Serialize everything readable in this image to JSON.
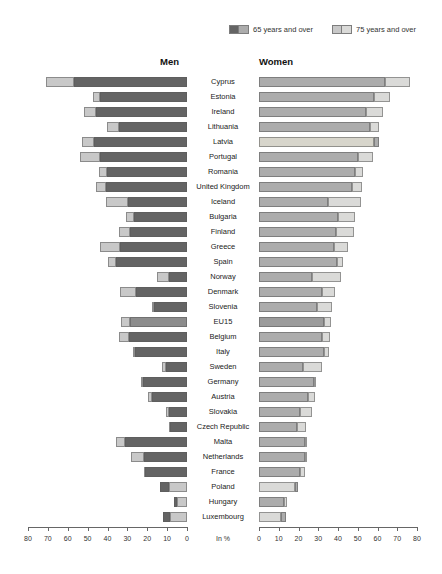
{
  "legend": {
    "items": [
      {
        "label": "65 years and over",
        "swatch": [
          "#646464",
          "#acacac"
        ]
      },
      {
        "label": "75 years and over",
        "swatch": [
          "#c8c8c8",
          "#dadad8"
        ]
      }
    ]
  },
  "headers": {
    "men": "Men",
    "women": "Women"
  },
  "axis": {
    "unit_label": "In %",
    "ticks": [
      0,
      10,
      20,
      30,
      40,
      50,
      60,
      70,
      80
    ],
    "max": 80
  },
  "colors": {
    "men_65": "#646464",
    "men_75": "#c8c8c8",
    "women_65": "#acacac",
    "women_75": "#dadad8",
    "eu15_men_65": "#8c8c8c",
    "eu15_women_65": "#9b9b9b",
    "latvia_women_75": "#d7d5cb",
    "axis": "#666666"
  },
  "chart_data": {
    "type": "bar",
    "orientation": "horizontal-mirrored",
    "unit": "%",
    "xlim": [
      0,
      80
    ],
    "grid": false,
    "legend_position": "top-right",
    "note": "Two overlapping bars per country and sex; the shorter of the 65+/75+ values is drawn on top, the longer shows as a lighter/darker tip.",
    "categories": [
      "Cyprus",
      "Estonia",
      "Ireland",
      "Lithuania",
      "Latvia",
      "Portugal",
      "Romania",
      "United Kingdom",
      "Iceland",
      "Bulgaria",
      "Finland",
      "Greece",
      "Spain",
      "Norway",
      "Denmark",
      "Slovenia",
      "EU15",
      "Belgium",
      "Italy",
      "Sweden",
      "Germany",
      "Austria",
      "Slovakia",
      "Czech Republic",
      "Malta",
      "Netherlands",
      "France",
      "Poland",
      "Hungary",
      "Luxembourg"
    ],
    "series": [
      {
        "name": "Men 65 years and over",
        "values": [
          57,
          44,
          46,
          34,
          47,
          44,
          40,
          41,
          29.5,
          26.5,
          28.5,
          33.5,
          35.5,
          9,
          25.5,
          16.5,
          28.5,
          29,
          26,
          10.5,
          22,
          17.5,
          9,
          8.5,
          31,
          21.5,
          21,
          13.5,
          6.5,
          12
        ]
      },
      {
        "name": "Men 75 years and over",
        "values": [
          71,
          47.5,
          52,
          40.5,
          53,
          54,
          44.5,
          46,
          41,
          30.5,
          34,
          44,
          40,
          15,
          33.5,
          17.5,
          33,
          34,
          27,
          12.5,
          23,
          19.5,
          10.5,
          9,
          35.5,
          28,
          21.5,
          9,
          5,
          8.5
        ]
      },
      {
        "name": "Women 65 years and over",
        "values": [
          64,
          58,
          54,
          56,
          61,
          50,
          48.5,
          47,
          35,
          40,
          39,
          38,
          39.5,
          27,
          32,
          29.5,
          33,
          32,
          33,
          22.5,
          28,
          25,
          21,
          19,
          23.5,
          23.5,
          21,
          19.5,
          12.5,
          13.5
        ]
      },
      {
        "name": "Women 75 years and over",
        "values": [
          76.5,
          66.5,
          63,
          61,
          58,
          57.5,
          52.5,
          52,
          51.5,
          48.5,
          48,
          45,
          42.5,
          41.5,
          38.5,
          37,
          36.5,
          36,
          35.5,
          32,
          29,
          28.5,
          27,
          24,
          24,
          24,
          23.5,
          18,
          14,
          11
        ]
      }
    ]
  }
}
